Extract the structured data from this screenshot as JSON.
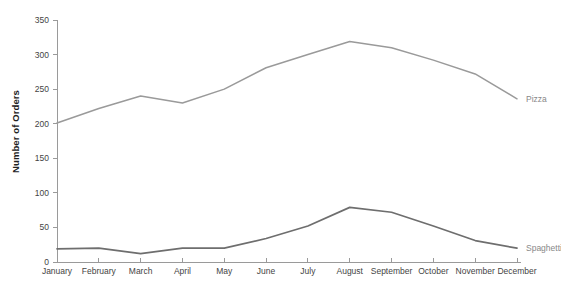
{
  "chart_data": {
    "type": "line",
    "title": "",
    "xlabel": "",
    "ylabel": "Number of Orders",
    "categories": [
      "January",
      "February",
      "March",
      "April",
      "May",
      "June",
      "July",
      "August",
      "September",
      "October",
      "November",
      "December"
    ],
    "series": [
      {
        "name": "Pizza",
        "color": "#9a9a9a",
        "values": [
          201,
          222,
          240,
          230,
          250,
          281,
          300,
          319,
          310,
          292,
          272,
          236
        ]
      },
      {
        "name": "Spaghetti",
        "color": "#6e6e6e",
        "values": [
          19,
          20,
          12,
          20,
          20,
          34,
          52,
          79,
          72,
          52,
          31,
          20
        ]
      }
    ],
    "ylim": [
      0,
      350
    ],
    "yticks": [
      0,
      50,
      100,
      150,
      200,
      250,
      300,
      350
    ],
    "ytick_labels": [
      "0",
      "50",
      "100",
      "150",
      "200",
      "250",
      "300",
      "350"
    ],
    "grid": false,
    "legend_position": "right-inline",
    "axis_color": "#9a9a9a",
    "tick_label_color": "#444444",
    "series_label_color": "#888888"
  }
}
